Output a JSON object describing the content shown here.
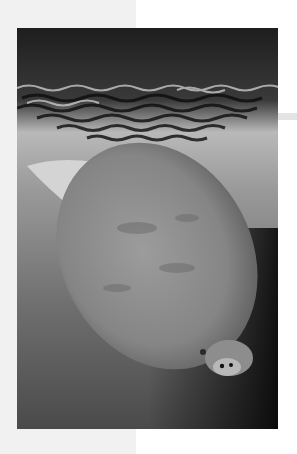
{
  "page": {
    "background": "#ffffff",
    "panel_color": "#f1f1f1"
  },
  "photo": {
    "subject": "manatee-in-water",
    "alt": "Black and white photograph of a manatee swimming near the water surface, with reflections of trees rippling at the top",
    "style": "grayscale"
  }
}
